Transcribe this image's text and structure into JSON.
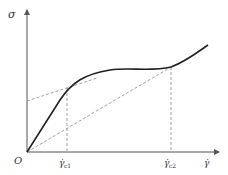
{
  "diagram": {
    "y_axis_label": "σ",
    "x_axis_label": "γ̇",
    "origin_label": "O",
    "marker1_label": "γ̇",
    "marker1_sub": "c1",
    "marker2_label": "γ̇",
    "marker2_sub": "c2",
    "colors": {
      "axis": "#555555",
      "curve": "#222222",
      "dashed": "#888888",
      "text": "#333333"
    }
  }
}
